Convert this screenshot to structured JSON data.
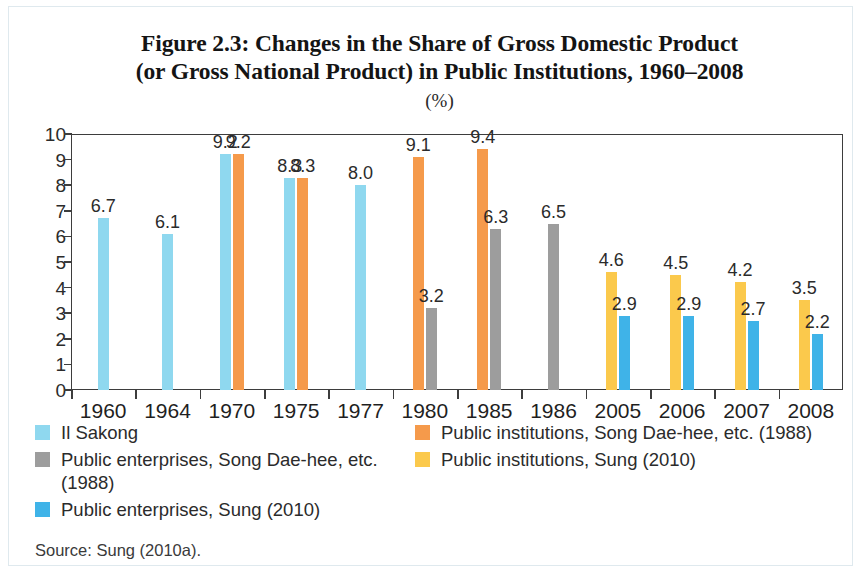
{
  "figure": {
    "title_line1": "Figure 2.3: Changes in the Share of Gross Domestic Product",
    "title_line2": "(or Gross National Product) in Public Institutions, 1960–2008",
    "units": "(%)",
    "source": "Source: Sung (2010a)."
  },
  "colors": {
    "light_blue": "#8fd8ef",
    "orange": "#f59a4b",
    "gray": "#9d9d9d",
    "yellow": "#fbc94c",
    "blue": "#3fb3e8",
    "axis": "#3d3d3d",
    "text": "#2b2b2b"
  },
  "legend": {
    "left": [
      {
        "label": "Il Sakong",
        "color_key": "light_blue",
        "swatch": "#8fd8ef"
      },
      {
        "label": "Public enterprises, Song Dae-hee, etc. (1988)",
        "color_key": "gray",
        "swatch": "#9d9d9d"
      },
      {
        "label": "Public enterprises, Sung (2010)",
        "color_key": "blue",
        "swatch": "#3fb3e8"
      }
    ],
    "right": [
      {
        "label": "Public institutions, Song Dae-hee, etc. (1988)",
        "color_key": "orange",
        "swatch": "#f59a4b"
      },
      {
        "label": "Public institutions, Sung (2010)",
        "color_key": "yellow",
        "swatch": "#fbc94c"
      }
    ]
  },
  "chart_data": {
    "type": "bar",
    "title": "Figure 2.3: Changes in the Share of Gross Domestic Product (or Gross National Product) in Public Institutions, 1960–2008",
    "subtitle": "(%)",
    "xlabel": "",
    "ylabel": "(%)",
    "ylim": [
      0,
      10
    ],
    "ytick_labels": [
      "0",
      "1",
      "2",
      "3",
      "4",
      "5",
      "6",
      "7",
      "8",
      "9",
      "10"
    ],
    "yticks": [
      0,
      1,
      2,
      3,
      4,
      5,
      6,
      7,
      8,
      9,
      10
    ],
    "grid": false,
    "legend_position": "below-plot",
    "categories": [
      "1960",
      "1964",
      "1970",
      "1975",
      "1977",
      "1980",
      "1985",
      "1986",
      "2005",
      "2006",
      "2007",
      "2008"
    ],
    "series": [
      {
        "name": "Il Sakong",
        "color": "#8fd8ef",
        "values": [
          6.7,
          6.1,
          9.2,
          8.3,
          8.0,
          null,
          null,
          null,
          null,
          null,
          null,
          null
        ]
      },
      {
        "name": "Public institutions, Song Dae-hee, etc. (1988)",
        "color": "#f59a4b",
        "values": [
          null,
          null,
          9.2,
          8.3,
          null,
          9.1,
          9.4,
          null,
          null,
          null,
          null,
          null
        ]
      },
      {
        "name": "Public enterprises, Song Dae-hee, etc. (1988)",
        "color": "#9d9d9d",
        "values": [
          null,
          null,
          null,
          null,
          null,
          3.2,
          6.3,
          6.5,
          null,
          null,
          null,
          null
        ]
      },
      {
        "name": "Public institutions, Sung (2010)",
        "color": "#fbc94c",
        "values": [
          null,
          null,
          null,
          null,
          null,
          null,
          null,
          null,
          4.6,
          4.5,
          4.2,
          3.5
        ]
      },
      {
        "name": "Public enterprises, Sung (2010)",
        "color": "#3fb3e8",
        "values": [
          null,
          null,
          null,
          null,
          null,
          null,
          null,
          null,
          2.9,
          2.9,
          2.7,
          2.2
        ]
      }
    ],
    "data_labels": [
      {
        "category": "1960",
        "series": "Il Sakong",
        "value": 6.7,
        "text": "6.7"
      },
      {
        "category": "1964",
        "series": "Il Sakong",
        "value": 6.1,
        "text": "6.1"
      },
      {
        "category": "1970",
        "series": "Il Sakong",
        "value": 9.2,
        "text": "9.2"
      },
      {
        "category": "1970",
        "series": "Public institutions, Song Dae-hee, etc. (1988)",
        "value": 9.2,
        "text": "9.2"
      },
      {
        "category": "1975",
        "series": "Il Sakong",
        "value": 8.3,
        "text": "8.3"
      },
      {
        "category": "1975",
        "series": "Public institutions, Song Dae-hee, etc. (1988)",
        "value": 8.3,
        "text": "8.3"
      },
      {
        "category": "1977",
        "series": "Il Sakong",
        "value": 8.0,
        "text": "8.0"
      },
      {
        "category": "1980",
        "series": "Public institutions, Song Dae-hee, etc. (1988)",
        "value": 9.1,
        "text": "9.1"
      },
      {
        "category": "1980",
        "series": "Public enterprises, Song Dae-hee, etc. (1988)",
        "value": 3.2,
        "text": "3.2"
      },
      {
        "category": "1985",
        "series": "Public institutions, Song Dae-hee, etc. (1988)",
        "value": 9.4,
        "text": "9.4"
      },
      {
        "category": "1985",
        "series": "Public enterprises, Song Dae-hee, etc. (1988)",
        "value": 6.3,
        "text": "6.3"
      },
      {
        "category": "1986",
        "series": "Public enterprises, Song Dae-hee, etc. (1988)",
        "value": 6.5,
        "text": "6.5"
      },
      {
        "category": "2005",
        "series": "Public institutions, Sung (2010)",
        "value": 4.6,
        "text": "4.6"
      },
      {
        "category": "2005",
        "series": "Public enterprises, Sung (2010)",
        "value": 2.9,
        "text": "2.9"
      },
      {
        "category": "2006",
        "series": "Public institutions, Sung (2010)",
        "value": 4.5,
        "text": "4.5"
      },
      {
        "category": "2006",
        "series": "Public enterprises, Sung (2010)",
        "value": 2.9,
        "text": "2.9"
      },
      {
        "category": "2007",
        "series": "Public institutions, Sung (2010)",
        "value": 4.2,
        "text": "4.2"
      },
      {
        "category": "2007",
        "series": "Public enterprises, Sung (2010)",
        "value": 2.7,
        "text": "2.7"
      },
      {
        "category": "2008",
        "series": "Public institutions, Sung (2010)",
        "value": 3.5,
        "text": "3.5"
      },
      {
        "category": "2008",
        "series": "Public enterprises, Sung (2010)",
        "value": 2.2,
        "text": "2.2"
      }
    ]
  }
}
